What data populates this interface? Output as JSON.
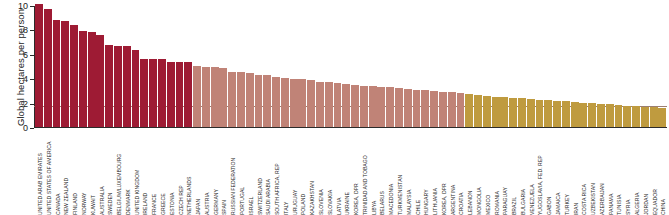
{
  "chart_data": {
    "type": "bar",
    "title": "",
    "xlabel": "",
    "ylabel": "Global hectares per person",
    "ylim": [
      0,
      10
    ],
    "yticks": [
      0,
      2,
      4,
      6,
      8,
      10
    ],
    "grid": false,
    "legend": "none",
    "annotations": [
      {
        "name": "world-average-reference-line",
        "value": 1.8,
        "orientation": "horizontal",
        "color": "#9b7f72"
      }
    ],
    "colors": {
      "high": "#9e1b34",
      "medium": "#c08377",
      "low": "#bf9b3f"
    },
    "categories": [
      "UNITED ARAB EMIRATES",
      "UNITED STATES OF AMERICA",
      "CANADA",
      "NEW ZEALAND",
      "FINLAND",
      "NORWAY",
      "KUWAIT",
      "AUSTRALIA",
      "SWEDEN",
      "BELGIUM/LUXEMBOURG",
      "DENMARK",
      "UNITED KINGDOM",
      "IRELAND",
      "FRANCE",
      "GREECE",
      "ESTONIA",
      "CZECH REP",
      "NETHERLANDS",
      "JAPAN",
      "AUSTRIA",
      "GERMANY",
      "SPAIN",
      "RUSSIAN FEDERATION",
      "PORTUGAL",
      "ISRAEL",
      "SWITZERLAND",
      "SAUDI ARABIA",
      "SOUTH AFRICA, REP",
      "ITALY",
      "URUGUAY",
      "POLAND",
      "KAZAKHSTAN",
      "SLOVENIA",
      "SLOVAKIA",
      "LATVIA",
      "UKRAINE",
      "KOREA, DPR",
      "TRINIDAD AND TOBAGO",
      "LIBYA",
      "BELARUS",
      "MACEDONIA",
      "TURKMENISTAN",
      "MALAYSIA",
      "CHILE",
      "HUNGARY",
      "LITHUANIA",
      "KOREA, DPR",
      "ARGENTINA",
      "CROATIA",
      "LEBANON",
      "MONGOLIA",
      "MEXICO",
      "ROMANIA",
      "PARAGUAY",
      "BRAZIL",
      "BULGARIA",
      "VENEZUELA",
      "YUGOSLAVIA, FED. REP",
      "GABON",
      "JAMAICA",
      "TURKEY",
      "IRAN",
      "COSTA RICA",
      "UZBEKISTAN",
      "AZERBAIJAN",
      "PANAMA",
      "TUNISIA",
      "SYRIA",
      "ALGERIA",
      "JORDAN",
      "EQUADOR",
      "CHINA"
    ],
    "values": [
      10.1,
      9.7,
      8.8,
      8.7,
      8.4,
      7.9,
      7.75,
      7.55,
      6.7,
      6.6,
      6.6,
      6.3,
      5.6,
      5.6,
      5.6,
      5.35,
      5.3,
      5.3,
      5.0,
      4.95,
      4.9,
      4.8,
      4.55,
      4.5,
      4.45,
      4.3,
      4.25,
      4.1,
      4.0,
      3.95,
      3.9,
      3.85,
      3.7,
      3.65,
      3.6,
      3.5,
      3.45,
      3.4,
      3.35,
      3.3,
      3.25,
      3.2,
      3.15,
      3.05,
      3.0,
      2.95,
      2.9,
      2.85,
      2.8,
      2.7,
      2.6,
      2.55,
      2.5,
      2.45,
      2.4,
      2.35,
      2.3,
      2.25,
      2.2,
      2.15,
      2.1,
      2.05,
      2.0,
      1.95,
      1.9,
      1.85,
      1.8,
      1.75,
      1.7,
      1.65,
      1.6,
      1.55
    ],
    "color_groups": [
      "high",
      "high",
      "high",
      "high",
      "high",
      "high",
      "high",
      "high",
      "high",
      "high",
      "high",
      "high",
      "high",
      "high",
      "high",
      "high",
      "high",
      "high",
      "medium",
      "medium",
      "medium",
      "medium",
      "medium",
      "medium",
      "medium",
      "medium",
      "medium",
      "medium",
      "medium",
      "medium",
      "medium",
      "medium",
      "medium",
      "medium",
      "medium",
      "medium",
      "medium",
      "medium",
      "medium",
      "medium",
      "medium",
      "medium",
      "medium",
      "medium",
      "medium",
      "medium",
      "medium",
      "medium",
      "medium",
      "low",
      "low",
      "low",
      "low",
      "low",
      "low",
      "low",
      "low",
      "low",
      "low",
      "low",
      "low",
      "low",
      "low",
      "low",
      "low",
      "low",
      "low",
      "low",
      "low",
      "low",
      "low",
      "low"
    ]
  }
}
